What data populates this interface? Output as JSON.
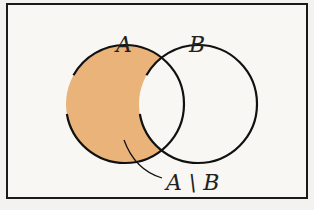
{
  "diagram": {
    "type": "venn",
    "sets": [
      {
        "label": "A",
        "cx": 125,
        "cy": 104,
        "r": 59
      },
      {
        "label": "B",
        "cx": 198,
        "cy": 104,
        "r": 59
      }
    ],
    "highlight": {
      "region": "A minus B",
      "label": "A \\ B",
      "color": "#e9b37a"
    },
    "colors": {
      "border": "#1a1a1a",
      "background": "#f8f7f3",
      "stroke": "#111111"
    }
  }
}
